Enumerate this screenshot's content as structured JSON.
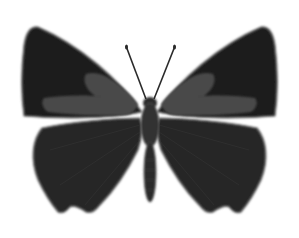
{
  "image": {
    "subject": "butterfly illustration (dorsal view)",
    "background": "#ffffff",
    "colors": {
      "wing_dark": "#1e1e1e",
      "wing_hind": "#262626",
      "patch": "#4a4a4a",
      "body": "#2c2c2c",
      "edge": "#6a6a6a"
    }
  }
}
